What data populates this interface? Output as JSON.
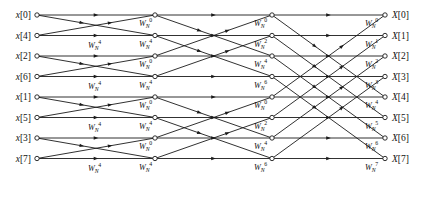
{
  "figure": {
    "type": "signal-flow-graph",
    "name": "radix-2 decimation-in-time FFT flow graph",
    "size": 8,
    "stages": 3,
    "background_color": "#ffffff",
    "line_color": "#1a1a1a",
    "node_fill": "#ffffff"
  },
  "inputs": [
    {
      "label": "x[0]",
      "var": "x",
      "index": "[0]",
      "row": 0
    },
    {
      "label": "x[4]",
      "var": "x",
      "index": "[4]",
      "row": 1
    },
    {
      "label": "x[2]",
      "var": "x",
      "index": "[2]",
      "row": 2
    },
    {
      "label": "x[6]",
      "var": "x",
      "index": "[6]",
      "row": 3
    },
    {
      "label": "x[1]",
      "var": "x",
      "index": "[1]",
      "row": 4
    },
    {
      "label": "x[5]",
      "var": "x",
      "index": "[5]",
      "row": 5
    },
    {
      "label": "x[3]",
      "var": "x",
      "index": "[3]",
      "row": 6
    },
    {
      "label": "x[7]",
      "var": "x",
      "index": "[7]",
      "row": 7
    }
  ],
  "outputs": [
    {
      "label": "X[0]",
      "var": "X",
      "index": "[0]",
      "row": 0
    },
    {
      "label": "X[1]",
      "var": "X",
      "index": "[1]",
      "row": 1
    },
    {
      "label": "X[2]",
      "var": "X",
      "index": "[2]",
      "row": 2
    },
    {
      "label": "X[3]",
      "var": "X",
      "index": "[3]",
      "row": 3
    },
    {
      "label": "X[4]",
      "var": "X",
      "index": "[4]",
      "row": 4
    },
    {
      "label": "X[5]",
      "var": "X",
      "index": "[5]",
      "row": 5
    },
    {
      "label": "X[6]",
      "var": "X",
      "index": "[6]",
      "row": 6
    },
    {
      "label": "X[7]",
      "var": "X",
      "index": "[7]",
      "row": 7
    }
  ],
  "twiddle": {
    "base": "W",
    "subscript": "N",
    "stage1_exponents": [
      "4",
      "4",
      "4",
      "4"
    ],
    "stage2_exponents": [
      "0",
      "4",
      "0",
      "4",
      "0",
      "4",
      "0",
      "4"
    ],
    "stage3_exponents": [
      "0",
      "2",
      "4",
      "6",
      "0",
      "2",
      "4",
      "6"
    ],
    "stage4_exponents": [
      "0",
      "1",
      "2",
      "3",
      "4",
      "5",
      "6",
      "7"
    ]
  },
  "stage_labels": {
    "stage1": [
      {
        "exp": "4",
        "row": 1
      },
      {
        "exp": "4",
        "row": 3
      },
      {
        "exp": "4",
        "row": 5
      },
      {
        "exp": "4",
        "row": 7
      }
    ],
    "stage2": [
      {
        "exp": "0",
        "row": 0
      },
      {
        "exp": "4",
        "row": 1
      },
      {
        "exp": "0",
        "row": 2
      },
      {
        "exp": "4",
        "row": 3
      },
      {
        "exp": "0",
        "row": 4
      },
      {
        "exp": "4",
        "row": 5
      },
      {
        "exp": "0",
        "row": 6
      },
      {
        "exp": "4",
        "row": 7
      }
    ],
    "stage3": [
      {
        "exp": "0",
        "row": 0
      },
      {
        "exp": "2",
        "row": 1
      },
      {
        "exp": "4",
        "row": 2
      },
      {
        "exp": "6",
        "row": 3
      },
      {
        "exp": "0",
        "row": 4
      },
      {
        "exp": "2",
        "row": 5
      },
      {
        "exp": "4",
        "row": 6
      },
      {
        "exp": "6",
        "row": 7
      }
    ],
    "stage4": [
      {
        "exp": "0",
        "row": 0
      },
      {
        "exp": "1",
        "row": 1
      },
      {
        "exp": "2",
        "row": 2
      },
      {
        "exp": "3",
        "row": 3
      },
      {
        "exp": "4",
        "row": 4
      },
      {
        "exp": "5",
        "row": 5
      },
      {
        "exp": "6",
        "row": 6
      },
      {
        "exp": "7",
        "row": 7
      }
    ]
  },
  "geometry": {
    "column_x": [
      37,
      155,
      272,
      385
    ],
    "row_y": [
      15,
      35.5,
      56,
      76.5,
      97,
      117.5,
      138,
      158.5
    ],
    "input_label_x": 31,
    "output_label_x": 392,
    "node_radius": 2.2
  },
  "connections": {
    "stage1_pairs": [
      [
        0,
        1
      ],
      [
        2,
        3
      ],
      [
        4,
        5
      ],
      [
        6,
        7
      ]
    ],
    "stage2_pairs": [
      [
        0,
        2
      ],
      [
        1,
        3
      ],
      [
        4,
        6
      ],
      [
        5,
        7
      ]
    ],
    "stage3_pairs": [
      [
        0,
        4
      ],
      [
        1,
        5
      ],
      [
        2,
        6
      ],
      [
        3,
        7
      ]
    ]
  }
}
